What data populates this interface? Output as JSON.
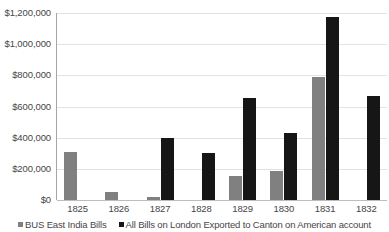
{
  "chart_data": {
    "type": "bar",
    "title": "",
    "subtitle": "",
    "xlabel": "",
    "ylabel": "",
    "categories": [
      "1825",
      "1826",
      "1827",
      "1828",
      "1829",
      "1830",
      "1831",
      "1832"
    ],
    "series": [
      {
        "name": "BUS East India Bills",
        "color": "#808080",
        "values": [
          305000,
          50000,
          20000,
          0,
          155000,
          185000,
          790000,
          0
        ]
      },
      {
        "name": "All Bills on London Exported to Canton on American account",
        "color": "#161616",
        "values": [
          0,
          0,
          400000,
          300000,
          655000,
          430000,
          1175000,
          670000
        ]
      }
    ],
    "ylim": [
      0,
      1200000
    ],
    "y_ticks": [
      0,
      200000,
      400000,
      600000,
      800000,
      1000000,
      1200000
    ],
    "y_tick_labels": [
      "$0",
      "$200,000",
      "$400,000",
      "$600,000",
      "$800,000",
      "$1,000,000",
      "$1,200,000"
    ],
    "grid": true,
    "legend_position": "bottom",
    "legend": [
      "BUS East India Bills",
      "All Bills on London Exported to Canton on American account"
    ]
  }
}
